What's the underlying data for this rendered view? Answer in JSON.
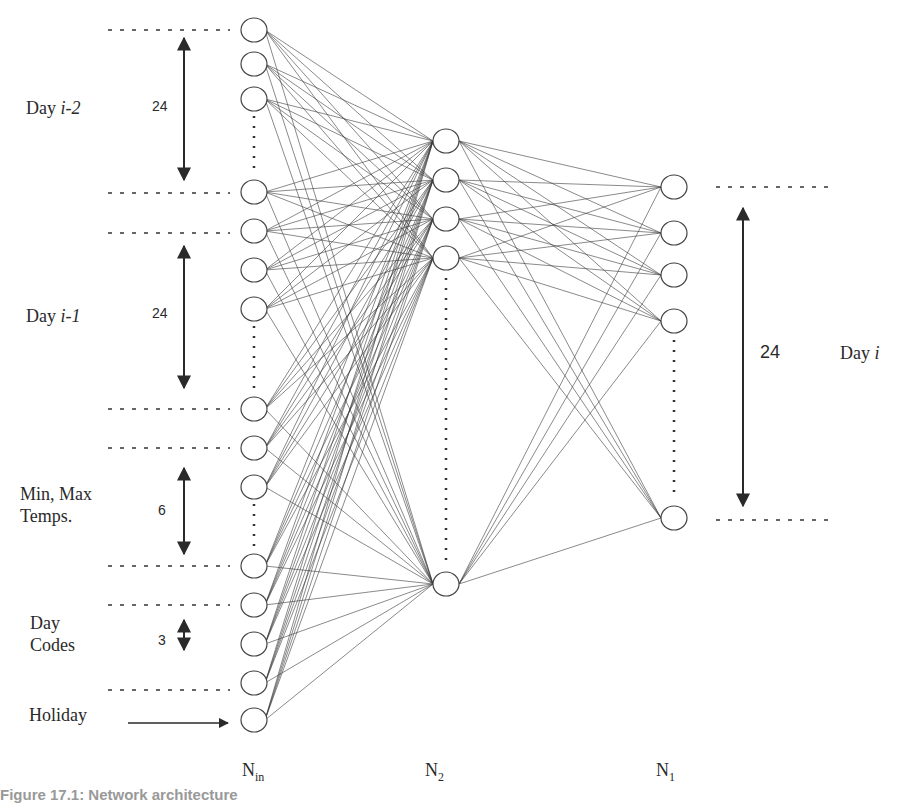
{
  "diagram": {
    "type": "neural-network-architecture",
    "input_groups": [
      {
        "label": "Day ",
        "label_italic": "i-2",
        "count": "24"
      },
      {
        "label": "Day ",
        "label_italic": "i-1",
        "count": "24"
      },
      {
        "label": "Min, Max",
        "label2": "Temps.",
        "count": "6"
      },
      {
        "label": "Day",
        "label2": "Codes",
        "count": "3"
      },
      {
        "label": "Holiday"
      }
    ],
    "output_group": {
      "label": "Day ",
      "label_italic": "i",
      "count": "24"
    },
    "layers": {
      "input": {
        "name": "N",
        "sub": "in"
      },
      "hidden": {
        "name": "N",
        "sub": "2"
      },
      "output": {
        "name": "N",
        "sub": "1"
      }
    },
    "caption": "Figure 17.1: Network architecture"
  }
}
